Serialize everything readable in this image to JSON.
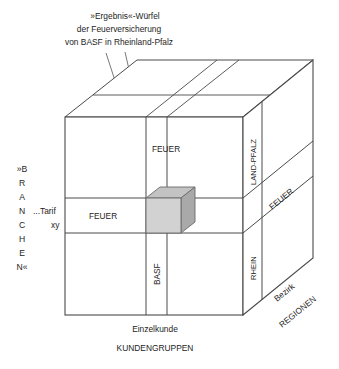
{
  "figure": {
    "title_lines": [
      "»Ergebnis«-Würfel",
      "der Feuerversicherung",
      "von BASF in Rheinland-Pfalz"
    ],
    "front_face": {
      "top_slice_label": "FEUER",
      "middle_slice_label": "FEUER",
      "column_label": "BASF"
    },
    "right_face": {
      "top_label": "LAND-PFALZ",
      "bottom_label": "RHEIN"
    },
    "top_face": {
      "diagonal_label": "FEUER"
    },
    "axes": {
      "left_axis_letters": [
        "»B",
        "R",
        "A",
        "N",
        "C",
        "H",
        "E",
        "N«"
      ],
      "left_axis_name": "»BRANCHEN«",
      "left_tick_line1": "...Tarif",
      "left_tick_line2": "xy",
      "bottom_tick": "Einzelkunde",
      "bottom_axis_name": "KUNDENGRUPPEN",
      "right_tick": "Bezirk",
      "right_axis_name": "REGIONEN"
    },
    "colors": {
      "outline": "#4a4a4a",
      "highlight_front": "#d2d2d2",
      "highlight_side": "#a9a9a9",
      "highlight_top": "#c0c0c0",
      "text": "#1d1d1d",
      "background": "#ffffff"
    },
    "highlight_cell_name": "result-cube"
  }
}
